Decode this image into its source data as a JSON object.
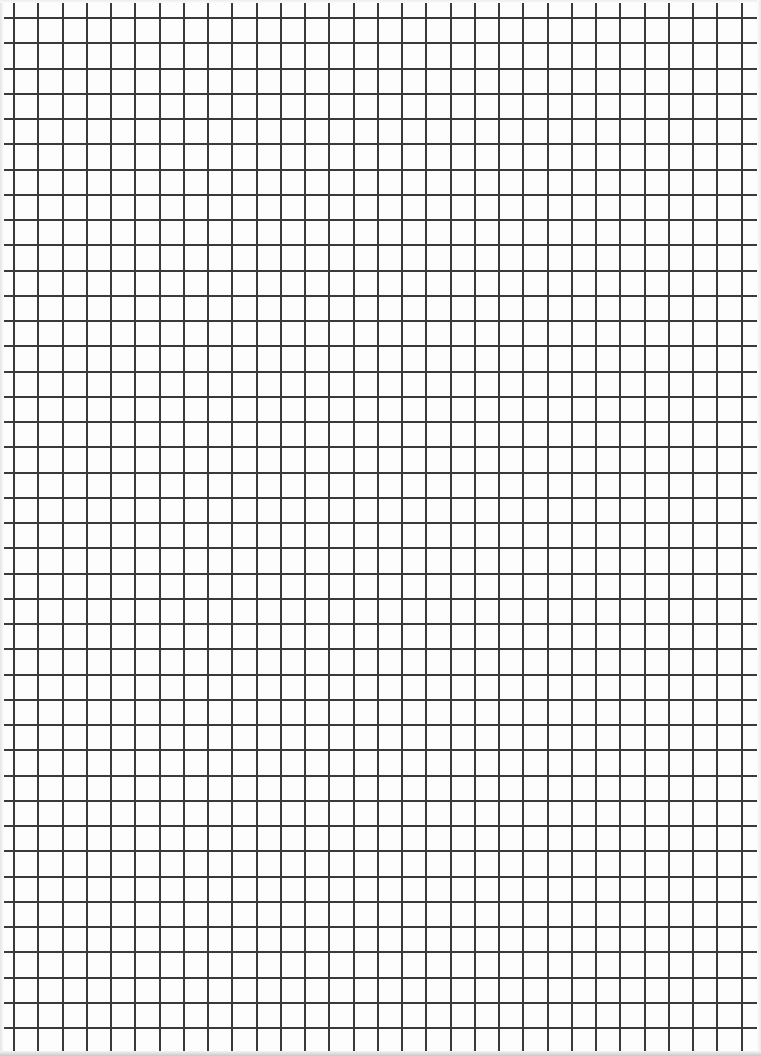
{
  "sheet": {
    "type": "graph-paper",
    "width": 761,
    "height": 1056,
    "background": "#fdfdfd",
    "line_color": "#3a3a3a",
    "line_width": 2,
    "vertical": {
      "start": 14,
      "spacing": 24.25,
      "count": 31
    },
    "horizontal": {
      "start": 18,
      "spacing": 25.25,
      "count": 41
    }
  }
}
